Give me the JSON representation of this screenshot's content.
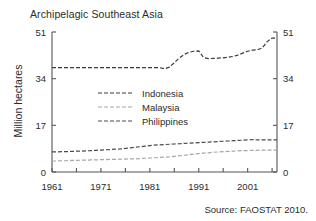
{
  "chart_data": {
    "type": "line",
    "title": "Archipelagic Southeast Asia",
    "xlabel": "",
    "ylabel": "Million hectares",
    "xlim": [
      1961,
      2007
    ],
    "ylim": [
      0,
      51
    ],
    "yticks": [
      0,
      17,
      34,
      51
    ],
    "ytick_labels": [
      "0",
      "17",
      "34",
      "51"
    ],
    "yticks_right": [
      0,
      17,
      34,
      51
    ],
    "ytick_labels_right": [
      "0",
      "17",
      "34",
      "51"
    ],
    "xticks": [
      1961,
      1971,
      1981,
      1991,
      2001
    ],
    "xtick_labels": [
      "1961",
      "1971",
      "1981",
      "1991",
      "2001"
    ],
    "xminor_step": 5,
    "grid": false,
    "legend_position": "center-left",
    "x": [
      1961,
      1962,
      1963,
      1964,
      1965,
      1966,
      1967,
      1968,
      1969,
      1970,
      1971,
      1972,
      1973,
      1974,
      1975,
      1976,
      1977,
      1978,
      1979,
      1980,
      1981,
      1982,
      1983,
      1984,
      1985,
      1986,
      1987,
      1988,
      1989,
      1990,
      1991,
      1992,
      1993,
      1994,
      1995,
      1996,
      1997,
      1998,
      1999,
      2000,
      2001,
      2002,
      2003,
      2004,
      2005,
      2006,
      2007
    ],
    "series": [
      {
        "name": "Indonesia",
        "color": "#3a3a3a",
        "dash": "4,2",
        "values": [
          38.0,
          38.0,
          38.0,
          38.0,
          38.0,
          38.0,
          38.0,
          38.0,
          38.0,
          38.0,
          38.0,
          38.0,
          38.0,
          38.0,
          38.0,
          38.0,
          38.0,
          38.0,
          38.0,
          38.0,
          38.0,
          38.0,
          38.0,
          37.6,
          38.2,
          39.8,
          41.5,
          42.8,
          43.6,
          44.0,
          44.1,
          41.7,
          41.3,
          41.4,
          41.5,
          41.6,
          41.8,
          42.1,
          42.6,
          43.3,
          44.0,
          44.4,
          44.5,
          45.2,
          47.5,
          48.8,
          48.7
        ]
      },
      {
        "name": "Malaysia",
        "color": "#a6a6a6",
        "dash": "4,2",
        "values": [
          4.0,
          4.0,
          4.1,
          4.1,
          4.2,
          4.2,
          4.3,
          4.3,
          4.4,
          4.4,
          4.5,
          4.5,
          4.6,
          4.6,
          4.7,
          4.7,
          4.8,
          4.8,
          4.9,
          5.0,
          5.1,
          5.2,
          5.3,
          5.4,
          5.5,
          5.7,
          5.9,
          6.1,
          6.3,
          6.5,
          6.7,
          6.9,
          7.0,
          7.2,
          7.3,
          7.4,
          7.5,
          7.6,
          7.7,
          7.8,
          7.8,
          7.9,
          7.9,
          8.0,
          8.0,
          8.0,
          8.0
        ]
      },
      {
        "name": "Philippines",
        "color": "#4a4a4a",
        "dash": "4,2",
        "values": [
          7.3,
          7.3,
          7.4,
          7.4,
          7.5,
          7.6,
          7.6,
          7.7,
          7.8,
          7.9,
          8.0,
          8.1,
          8.2,
          8.3,
          8.4,
          8.6,
          8.8,
          9.0,
          9.2,
          9.4,
          9.6,
          9.8,
          9.9,
          10.0,
          10.1,
          10.2,
          10.3,
          10.4,
          10.5,
          10.6,
          10.7,
          10.8,
          10.9,
          11.0,
          11.1,
          11.2,
          11.3,
          11.4,
          11.5,
          11.6,
          11.7,
          11.8,
          11.7,
          11.7,
          11.7,
          11.7,
          11.7
        ]
      }
    ],
    "source_note": "Source: FAOSTAT 2010."
  }
}
